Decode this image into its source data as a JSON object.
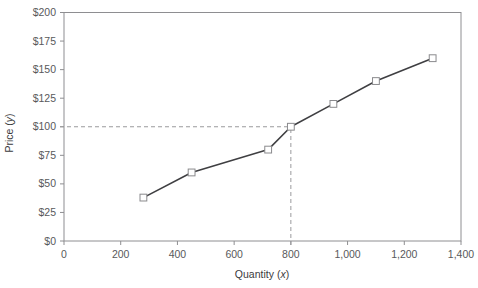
{
  "chart_data": {
    "type": "line",
    "title": "",
    "xlabel": "Quantity (x)",
    "ylabel": "Price (y)",
    "xlim": [
      0,
      1400
    ],
    "ylim": [
      0,
      200
    ],
    "grid": false,
    "legend": "none",
    "x_ticks": [
      0,
      200,
      400,
      600,
      800,
      1000,
      1200,
      1400
    ],
    "x_tick_labels": [
      "0",
      "200",
      "400",
      "600",
      "800",
      "1,000",
      "1,200",
      "1,400"
    ],
    "y_ticks": [
      0,
      25,
      50,
      75,
      100,
      125,
      150,
      175,
      200
    ],
    "y_tick_labels": [
      "$0",
      "$25",
      "$50",
      "$75",
      "$100",
      "$125",
      "$150",
      "$175",
      "$200"
    ],
    "series": [
      {
        "name": "supply",
        "marker": "open-square",
        "line_color": "#3f3f42",
        "marker_color": "#ffffff",
        "marker_edge_color": "#8a8a8d",
        "x": [
          280,
          450,
          720,
          800,
          950,
          1100,
          1300
        ],
        "y": [
          38,
          60,
          80,
          100,
          120,
          140,
          160
        ]
      }
    ],
    "annotations": [
      {
        "name": "equilibrium-guide-horizontal",
        "type": "dashed-line",
        "orientation": "horizontal",
        "value": 100,
        "from_x": 0,
        "to_x": 800,
        "color": "#9a9a9d"
      },
      {
        "name": "equilibrium-guide-vertical",
        "type": "dashed-line",
        "orientation": "vertical",
        "value": 800,
        "from_y": 0,
        "to_y": 100,
        "color": "#9a9a9d"
      }
    ]
  },
  "axis": {
    "x_title": "Quantity (x)",
    "x_title_var": "x",
    "y_title": "Price (y)",
    "y_title_var": "y",
    "x_labels": [
      "0",
      "200",
      "400",
      "600",
      "800",
      "1,000",
      "1,200",
      "1,400"
    ],
    "y_labels": [
      "$200",
      "$175",
      "$150",
      "$125",
      "$100",
      "$75",
      "$50",
      "$25",
      "$0"
    ]
  },
  "colors": {
    "line": "#3f3f42",
    "frame": "#8e8e91",
    "text": "#58595b",
    "dashed": "#9a9a9d",
    "marker_fill": "#ffffff",
    "marker_edge": "#8a8a8d"
  }
}
